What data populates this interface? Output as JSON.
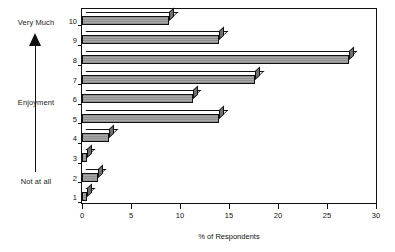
{
  "chart_data": {
    "type": "bar",
    "orientation": "horizontal",
    "title": "",
    "xlabel": "% of Respondents",
    "ylabel": "Enjoyment",
    "categories": [
      "1",
      "2",
      "3",
      "4",
      "5",
      "6",
      "7",
      "8",
      "9",
      "10"
    ],
    "values": [
      0.5,
      1.6,
      0.5,
      2.8,
      14,
      11.3,
      17.7,
      27.2,
      14,
      8.9
    ],
    "xlim": [
      0,
      30
    ],
    "xticks": [
      0,
      5,
      10,
      15,
      20,
      25,
      30
    ],
    "xtick_labels": [
      "0",
      "5",
      "10",
      "15",
      "20",
      "25",
      "30"
    ],
    "grid": false,
    "legend": "none",
    "style": "3d-horizontal-bars",
    "bar_color": "#9a9a9a"
  },
  "annotations": {
    "top_label": "Very Much",
    "middle_label": "Enjoyment",
    "bottom_label": "Not at all",
    "arrow": "up-arrow"
  }
}
